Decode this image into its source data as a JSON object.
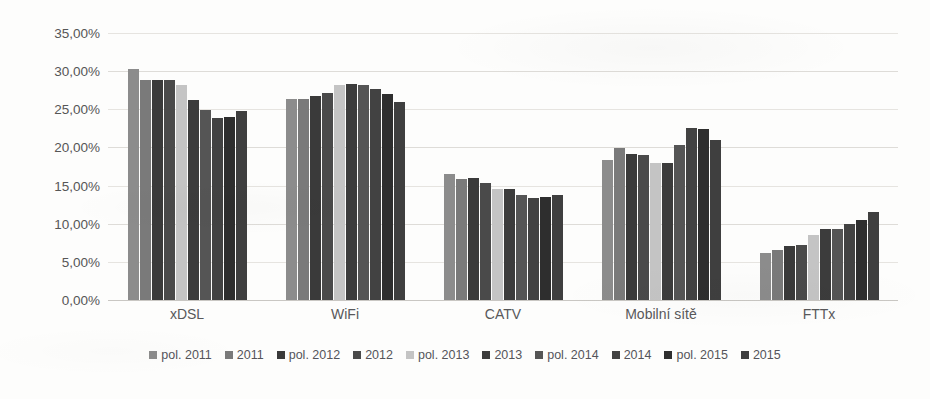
{
  "chart_data": {
    "type": "bar",
    "title": "",
    "subtitle": "",
    "xlabel": "",
    "ylabel": "",
    "categories": [
      "xDSL",
      "WiFi",
      "CATV",
      "Mobilní sítě",
      "FTTx"
    ],
    "ylim": [
      0,
      35
    ],
    "ytick_labels": [
      "0,00%",
      "5,00%",
      "10,00%",
      "15,00%",
      "20,00%",
      "25,00%",
      "30,00%",
      "35,00%"
    ],
    "ytick_values": [
      0,
      5,
      10,
      15,
      20,
      25,
      30,
      35
    ],
    "grid": true,
    "legend_position": "bottom",
    "value_suffix": "%",
    "decimal_separator": ",",
    "series": [
      {
        "name": "pol. 2011",
        "color": "#8c8c8c",
        "values": [
          30.3,
          26.3,
          16.5,
          18.4,
          6.1
        ]
      },
      {
        "name": "2011",
        "color": "#7a7a7a",
        "values": [
          28.8,
          26.4,
          15.9,
          19.9,
          6.6
        ]
      },
      {
        "name": "pol. 2012",
        "color": "#3a3a3a",
        "values": [
          28.9,
          26.7,
          16.0,
          19.2,
          7.1
        ]
      },
      {
        "name": "2012",
        "color": "#4a4a4a",
        "values": [
          28.8,
          27.1,
          15.3,
          19.0,
          7.2
        ]
      },
      {
        "name": "pol. 2013",
        "color": "#c4c4c4",
        "values": [
          28.2,
          28.2,
          14.6,
          17.9,
          8.5
        ]
      },
      {
        "name": "2013",
        "color": "#3c3c3c",
        "values": [
          26.2,
          28.3,
          14.6,
          17.9,
          9.3
        ]
      },
      {
        "name": "pol. 2014",
        "color": "#555555",
        "values": [
          24.9,
          28.2,
          13.8,
          20.3,
          9.3
        ]
      },
      {
        "name": "2014",
        "color": "#424242",
        "values": [
          23.9,
          27.6,
          13.4,
          22.5,
          10.0
        ]
      },
      {
        "name": "pol. 2015",
        "color": "#2e2e2e",
        "values": [
          24.0,
          27.0,
          13.5,
          22.4,
          10.5
        ]
      },
      {
        "name": "2015",
        "color": "#3f3f3f",
        "values": [
          24.8,
          26.0,
          13.8,
          21.0,
          11.5
        ]
      }
    ]
  }
}
